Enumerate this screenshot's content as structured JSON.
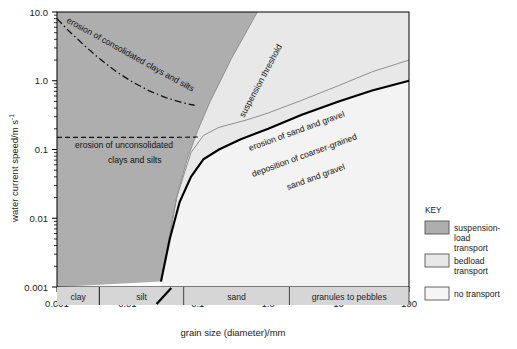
{
  "chart_data": {
    "type": "line",
    "title": "",
    "xlabel": "grain size (diameter)/mm",
    "ylabel": "water current speed/m s",
    "ylabel_sup": "-1",
    "xlim": [
      0.001,
      100
    ],
    "ylim": [
      0.001,
      10
    ],
    "xscale": "log",
    "yscale": "log",
    "grid": false,
    "xticks": [
      "0.001",
      "0.01",
      "0.1",
      "1.0",
      "10",
      "100"
    ],
    "xtick_values": [
      0.001,
      0.01,
      0.1,
      1,
      10,
      100
    ],
    "yticks": [
      "10.0",
      "1.0",
      "0.1",
      "0.01",
      "0.001"
    ],
    "ytick_values": [
      10,
      1,
      0.1,
      0.01,
      0.001
    ],
    "series": [
      {
        "name": "erosion of consolidated clays and silts",
        "style": "dash-dot",
        "color": "#111111",
        "points": [
          [
            0.001,
            8.0
          ],
          [
            0.0015,
            5.2
          ],
          [
            0.0025,
            3.2
          ],
          [
            0.004,
            2.1
          ],
          [
            0.007,
            1.35
          ],
          [
            0.012,
            0.95
          ],
          [
            0.02,
            0.72
          ],
          [
            0.035,
            0.57
          ],
          [
            0.06,
            0.48
          ],
          [
            0.09,
            0.44
          ]
        ]
      },
      {
        "name": "erosion of unconsolidated clays and silts",
        "style": "dashed",
        "color": "#111111",
        "points": [
          [
            0.001,
            0.15
          ],
          [
            0.01,
            0.15
          ],
          [
            0.05,
            0.15
          ],
          [
            0.1,
            0.152
          ]
        ]
      },
      {
        "name": "suspension threshold",
        "style": "solid-gray",
        "color": "#8f8f8f",
        "points": [
          [
            0.03,
            0.0012
          ],
          [
            0.05,
            0.02
          ],
          [
            0.07,
            0.07
          ],
          [
            0.1,
            0.19
          ],
          [
            0.15,
            0.5
          ],
          [
            0.22,
            1.1
          ],
          [
            0.3,
            2.1
          ],
          [
            0.45,
            4.4
          ],
          [
            0.6,
            7.5
          ],
          [
            0.7,
            10.0
          ]
        ]
      },
      {
        "name": "erosion of sand and gravel",
        "style": "solid-gray",
        "color": "#8f8f8f",
        "points": [
          [
            0.03,
            0.0012
          ],
          [
            0.05,
            0.02
          ],
          [
            0.08,
            0.09
          ],
          [
            0.12,
            0.16
          ],
          [
            0.2,
            0.21
          ],
          [
            0.5,
            0.27
          ],
          [
            1.0,
            0.34
          ],
          [
            3.0,
            0.52
          ],
          [
            10.0,
            0.85
          ],
          [
            30.0,
            1.35
          ],
          [
            100.0,
            2.0
          ]
        ]
      },
      {
        "name": "deposition of coarser-grained sand and gravel",
        "style": "solid-black",
        "color": "#000000",
        "points": [
          [
            0.03,
            0.0012
          ],
          [
            0.04,
            0.005
          ],
          [
            0.055,
            0.017
          ],
          [
            0.08,
            0.04
          ],
          [
            0.12,
            0.072
          ],
          [
            0.2,
            0.1
          ],
          [
            0.4,
            0.14
          ],
          [
            1.0,
            0.2
          ],
          [
            3.0,
            0.32
          ],
          [
            10.0,
            0.5
          ],
          [
            30.0,
            0.72
          ],
          [
            100.0,
            1.0
          ]
        ]
      }
    ],
    "annotations": [
      {
        "text": "erosion of consolidated clays and silts",
        "x": 66,
        "y": 22,
        "rotate": 29
      },
      {
        "text": "erosion of unconsolidated",
        "x": 75,
        "y": 148,
        "rotate": 0
      },
      {
        "text": "clays and silts",
        "x": 108,
        "y": 163,
        "rotate": 0
      },
      {
        "text": "suspension threshold",
        "x": 244,
        "y": 118,
        "rotate": -62
      },
      {
        "text": "erosion of sand and gravel",
        "x": 250,
        "y": 151,
        "rotate": -20
      },
      {
        "text": "deposition of coarser-grained",
        "x": 253,
        "y": 177,
        "rotate": -20
      },
      {
        "text": "sand and gravel",
        "x": 288,
        "y": 190,
        "rotate": -20
      }
    ],
    "categories": [
      {
        "label": "clay",
        "from": 0.001,
        "to": 0.004
      },
      {
        "label": "silt",
        "from": 0.004,
        "to": 0.063
      },
      {
        "label": "sand",
        "from": 0.063,
        "to": 2.0
      },
      {
        "label": "granules to pebbles",
        "from": 2.0,
        "to": 100
      }
    ],
    "regions": [
      {
        "name": "suspension-load transport",
        "color": "#aeaeae"
      },
      {
        "name": "bedload transport",
        "color": "#e8e8e8"
      },
      {
        "name": "no transport",
        "color": "#f3f3f3"
      }
    ]
  },
  "key": {
    "title": "KEY",
    "items": [
      {
        "label_line1": "suspension-",
        "label_line2": "load",
        "label_line3": "transport",
        "color": "#aeaeae"
      },
      {
        "label_line1": "bedload",
        "label_line2": "transport",
        "label_line3": "",
        "color": "#e8e8e8"
      },
      {
        "label_line1": "no transport",
        "label_line2": "",
        "label_line3": "",
        "color": "#f5f5f5"
      }
    ]
  }
}
